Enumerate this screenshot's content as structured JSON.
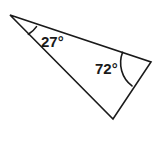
{
  "figure": {
    "name": "triangle-with-angle-measures",
    "background_color": "#ffffff",
    "stroke_color": "#1a1a1a",
    "text_color": "#1a1a1a",
    "stroke_width": 1.6,
    "vertices": {
      "left": {
        "label": "left-vertex",
        "x": 10,
        "y": 15
      },
      "right": {
        "label": "right-vertex",
        "x": 151,
        "y": 62
      },
      "bottom": {
        "label": "bottom-vertex",
        "x": 113,
        "y": 119
      }
    },
    "polygon_points": "10,15 151,62 113,119",
    "angles": [
      {
        "name": "angle-left",
        "value": "27°",
        "vertex": "left",
        "label_x": 41,
        "label_y": 47,
        "font_size": 15,
        "arc_path": "M 36.5 26.6 A 27 27 0 0 1 28.4 34.3",
        "arc_radius": 27
      },
      {
        "name": "angle-right",
        "value": "72°",
        "vertex": "right",
        "label_x": 95,
        "label_y": 74,
        "font_size": 15,
        "arc_path": "M 122.6 52.3 A 29 29 0 0 0 132.0 85.9",
        "arc_radius": 29
      }
    ]
  }
}
